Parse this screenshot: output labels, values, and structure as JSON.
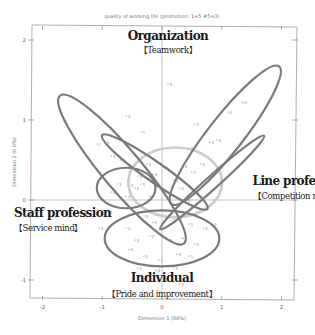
{
  "chart_data": {
    "type": "scatter",
    "title": "quality of working life (promotion: 1=5 #5=3)",
    "xlabel": "Dimension 1 (64%)",
    "ylabel": "Dimension 2 (6.6%)",
    "xlim": [
      -2.2,
      2.2
    ],
    "ylim": [
      -1.2,
      2.1
    ],
    "xticks": [
      -2,
      -1,
      0,
      1,
      2
    ],
    "yticks": [
      -1,
      0,
      1,
      2
    ],
    "xtick_labels": [
      "-2",
      "-1",
      "0",
      "1",
      "2"
    ],
    "ytick_labels": [
      "-1",
      "0",
      "1",
      "2"
    ],
    "grid": false,
    "reference_lines": {
      "x": 0,
      "y": 0
    },
    "pole_labels": [
      {
        "name": "top",
        "title": "Organization",
        "subtitle": "【Teamwork】"
      },
      {
        "name": "right",
        "title": "Line profession",
        "subtitle": "【Competition mind】"
      },
      {
        "name": "left",
        "title": "Staff profession",
        "subtitle": "【Service mind】"
      },
      {
        "name": "bottom",
        "title": "Individual",
        "subtitle": "【Pride and improvement】"
      }
    ],
    "ellipses": [
      {
        "name": "group-ellipse-1",
        "cx": 1.06,
        "cy": 0.81,
        "rx": 1.25,
        "ry": 0.25,
        "angle": -52,
        "color": "#7a7a7a"
      },
      {
        "name": "group-ellipse-2",
        "cx": -0.67,
        "cy": 0.38,
        "rx": 1.38,
        "ry": 0.28,
        "angle": 50,
        "color": "#7a7a7a"
      },
      {
        "name": "group-ellipse-3",
        "cx": -0.12,
        "cy": 0.35,
        "rx": 0.92,
        "ry": 0.14,
        "angle": 35,
        "color": "#7a7a7a"
      },
      {
        "name": "group-ellipse-4",
        "cx": 0.84,
        "cy": 0.22,
        "rx": 1.0,
        "ry": 0.09,
        "angle": -42,
        "color": "#7a7a7a"
      },
      {
        "name": "group-ellipse-5",
        "cx": -0.6,
        "cy": 0.15,
        "rx": 0.42,
        "ry": 0.29,
        "angle": 0,
        "color": "#7a7a7a"
      },
      {
        "name": "group-ellipse-6",
        "cx": 0.0,
        "cy": -0.48,
        "rx": 0.82,
        "ry": 0.4,
        "angle": 0,
        "color": "#7a7a7a"
      },
      {
        "name": "group-ellipse-7",
        "cx": 0.22,
        "cy": 0.22,
        "rx": 0.67,
        "ry": 0.5,
        "angle": 0,
        "color": "#cccccc"
      }
    ],
    "points": [
      {
        "x": 0.1,
        "y": 1.45,
        "label": "3"
      },
      {
        "x": -0.6,
        "y": 1.05,
        "label": "4"
      },
      {
        "x": 0.55,
        "y": 0.95,
        "label": "2"
      },
      {
        "x": 1.35,
        "y": 1.22,
        "label": "4"
      },
      {
        "x": 1.1,
        "y": 1.1,
        "label": "4"
      },
      {
        "x": -0.35,
        "y": 0.85,
        "label": "1"
      },
      {
        "x": 0.92,
        "y": 0.75,
        "label": "4"
      },
      {
        "x": 0.8,
        "y": 0.72,
        "label": "3"
      },
      {
        "x": 0.45,
        "y": 0.65,
        "label": "1"
      },
      {
        "x": -1.1,
        "y": 0.7,
        "label": "2"
      },
      {
        "x": -0.95,
        "y": 0.72,
        "label": "1"
      },
      {
        "x": -0.85,
        "y": 0.55,
        "label": "5"
      },
      {
        "x": -0.7,
        "y": 0.5,
        "label": "3"
      },
      {
        "x": -0.25,
        "y": 0.45,
        "label": "3"
      },
      {
        "x": 0.05,
        "y": 0.4,
        "label": "1"
      },
      {
        "x": 0.35,
        "y": 0.42,
        "label": "4"
      },
      {
        "x": 0.5,
        "y": 0.35,
        "label": "1"
      },
      {
        "x": -0.4,
        "y": 0.3,
        "label": "3"
      },
      {
        "x": -0.15,
        "y": 0.32,
        "label": "4"
      },
      {
        "x": 0.2,
        "y": 0.25,
        "label": "3"
      },
      {
        "x": -0.75,
        "y": 0.2,
        "label": "3"
      },
      {
        "x": -0.55,
        "y": 0.18,
        "label": "1"
      },
      {
        "x": -0.45,
        "y": 0.15,
        "label": "2"
      },
      {
        "x": -0.35,
        "y": 0.2,
        "label": "1"
      },
      {
        "x": 0.3,
        "y": 0.15,
        "label": "2"
      },
      {
        "x": -0.85,
        "y": 0.1,
        "label": "4"
      },
      {
        "x": -0.6,
        "y": 0.05,
        "label": "3"
      },
      {
        "x": -0.2,
        "y": 0.05,
        "label": "3"
      },
      {
        "x": 0.55,
        "y": 0.1,
        "label": "5"
      },
      {
        "x": -0.3,
        "y": -0.2,
        "label": "3"
      },
      {
        "x": -0.15,
        "y": -0.28,
        "label": "1"
      },
      {
        "x": 0.15,
        "y": -0.25,
        "label": "2"
      },
      {
        "x": 0.45,
        "y": -0.3,
        "label": "1"
      },
      {
        "x": 0.7,
        "y": -0.35,
        "label": "1"
      },
      {
        "x": -0.6,
        "y": -0.35,
        "label": "2"
      },
      {
        "x": -0.45,
        "y": -0.5,
        "label": "3"
      },
      {
        "x": -0.2,
        "y": -0.45,
        "label": "2"
      },
      {
        "x": 0.1,
        "y": -0.5,
        "label": "1"
      },
      {
        "x": 0.35,
        "y": -0.48,
        "label": "1"
      },
      {
        "x": 0.55,
        "y": -0.55,
        "label": "1"
      },
      {
        "x": -0.55,
        "y": -0.62,
        "label": "1"
      },
      {
        "x": -0.3,
        "y": -0.7,
        "label": "1"
      },
      {
        "x": -0.05,
        "y": -0.75,
        "label": "1"
      },
      {
        "x": 0.25,
        "y": -0.68,
        "label": "3"
      },
      {
        "x": 0.45,
        "y": -0.7,
        "label": "1"
      },
      {
        "x": -0.4,
        "y": -0.85,
        "label": "2"
      },
      {
        "x": -0.1,
        "y": -0.88,
        "label": "4"
      },
      {
        "x": 0.2,
        "y": -0.85,
        "label": "1"
      },
      {
        "x": 0.3,
        "y": -1.05,
        "label": "1"
      },
      {
        "x": -1.05,
        "y": -0.35,
        "label": "2"
      },
      {
        "x": -0.9,
        "y": -0.15,
        "label": "2"
      },
      {
        "x": 0.65,
        "y": 0.45,
        "label": "1"
      },
      {
        "x": 0.85,
        "y": -0.3,
        "label": "1"
      },
      {
        "x": 0.4,
        "y": 0.0,
        "label": "4"
      }
    ],
    "legend": null
  }
}
